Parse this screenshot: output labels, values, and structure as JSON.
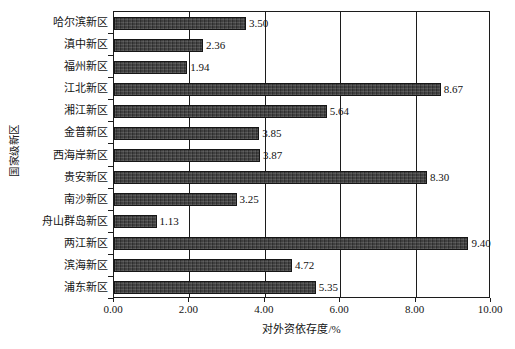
{
  "chart_data": {
    "type": "bar",
    "orientation": "horizontal",
    "title": "",
    "xlabel": "对外资依存度/%",
    "ylabel": "国家级新区",
    "xlim": [
      0.0,
      10.0
    ],
    "xticks": [
      "0.00",
      "2.00",
      "4.00",
      "6.00",
      "8.00",
      "10.00"
    ],
    "xtick_values": [
      0.0,
      2.0,
      4.0,
      6.0,
      8.0,
      10.0
    ],
    "grid": true,
    "grid_axis": "x",
    "legend": false,
    "bar_color": "#3b3b3b",
    "categories": [
      "哈尔滨新区",
      "滇中新区",
      "福州新区",
      "江北新区",
      "湘江新区",
      "金普新区",
      "西海岸新区",
      "贵安新区",
      "南沙新区",
      "舟山群岛新区",
      "两江新区",
      "滨海新区",
      "浦东新区"
    ],
    "values": [
      3.5,
      2.36,
      1.94,
      8.67,
      5.64,
      3.85,
      3.87,
      8.3,
      3.25,
      1.13,
      9.4,
      4.72,
      5.35
    ],
    "value_labels": [
      "3.50",
      "2.36",
      "1.94",
      "8.67",
      "5.64",
      "3.85",
      "3.87",
      "8.30",
      "3.25",
      "1.13",
      "9.40",
      "4.72",
      "5.35"
    ]
  }
}
